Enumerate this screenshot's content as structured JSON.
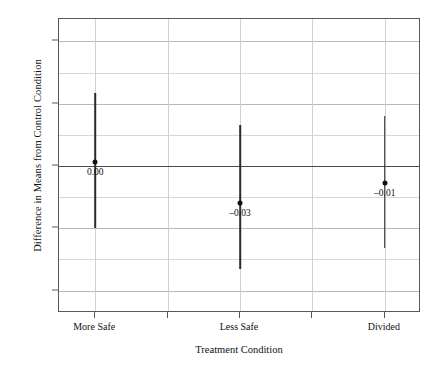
{
  "chart_data": {
    "type": "scatter",
    "title": "",
    "xlabel": "Treatment Condition",
    "ylabel": "Difference in Means from Control Condition",
    "categories": [
      "More Safe",
      "Less Safe",
      "Divided"
    ],
    "values": [
      0.003,
      -0.03,
      -0.014
    ],
    "point_labels": [
      "0.00",
      "–0.03",
      "–0.01"
    ],
    "error_low": [
      -0.05,
      -0.083,
      -0.066
    ],
    "error_high": [
      0.059,
      0.033,
      0.04
    ],
    "ylim": [
      -0.118,
      0.118
    ],
    "ytick_labels": [
      "0.10",
      "0.05",
      "0.00",
      "–0.05",
      "–0.10"
    ],
    "ytick_values": [
      0.1,
      0.05,
      0.0,
      -0.05,
      -0.1
    ],
    "minor_gridline_values": [
      0.075,
      0.025,
      -0.025,
      -0.075
    ],
    "xtick_positions": [
      1,
      2,
      3,
      4,
      5
    ],
    "vertical_gridline_positions": [
      1,
      2,
      3,
      4,
      5
    ],
    "zero_reference_line": 0.0,
    "grid": true,
    "legend": "none",
    "marker": "filled-circle",
    "error_bar_style": "vertical-line"
  },
  "colors": {
    "axis": "#58585a",
    "major_grid": "#b9b9bb",
    "minor_grid": "#d6d6d8",
    "vertical_grid": "#d0d0d2",
    "zero_line": "#4a4a4c",
    "marker": "#111111",
    "error_bar": "#2b2b2d",
    "background": "#ffffff"
  }
}
